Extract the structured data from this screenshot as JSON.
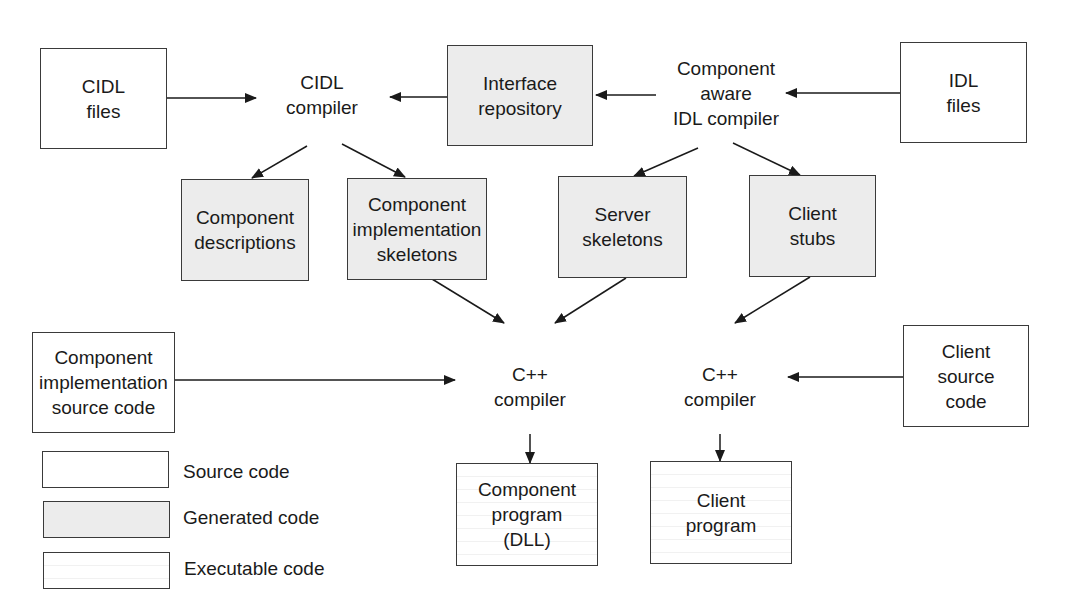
{
  "nodes": {
    "cidl_files": "CIDL\nfiles",
    "cidl_compiler": "CIDL\ncompiler",
    "interface_repository": "Interface\nrepository",
    "component_aware_idl_compiler": "Component\naware\nIDL compiler",
    "idl_files": "IDL\nfiles",
    "component_descriptions": "Component\ndescriptions",
    "component_implementation_skeletons": "Component\nimplementation\nskeletons",
    "server_skeletons": "Server\nskeletons",
    "client_stubs": "Client\nstubs",
    "component_implementation_source_code": "Component\nimplementation\nsource code",
    "cpp_compiler_component": "C++\ncompiler",
    "cpp_compiler_client": "C++\ncompiler",
    "client_source_code": "Client\nsource\ncode",
    "component_program": "Component\nprogram\n(DLL)",
    "client_program": "Client\nprogram"
  },
  "legend": {
    "source": "Source code",
    "generated": "Generated code",
    "executable": "Executable code"
  },
  "colors": {
    "line": "#1a1a1a",
    "generated_fill": "#ececec",
    "source_fill": "#ffffff"
  },
  "edges": [
    [
      "cidl_files",
      "cidl_compiler"
    ],
    [
      "interface_repository",
      "cidl_compiler"
    ],
    [
      "component_aware_idl_compiler",
      "interface_repository"
    ],
    [
      "idl_files",
      "component_aware_idl_compiler"
    ],
    [
      "cidl_compiler",
      "component_descriptions"
    ],
    [
      "cidl_compiler",
      "component_implementation_skeletons"
    ],
    [
      "component_aware_idl_compiler",
      "server_skeletons"
    ],
    [
      "component_aware_idl_compiler",
      "client_stubs"
    ],
    [
      "component_implementation_skeletons",
      "cpp_compiler_component"
    ],
    [
      "server_skeletons",
      "cpp_compiler_component"
    ],
    [
      "client_stubs",
      "cpp_compiler_client"
    ],
    [
      "component_implementation_source_code",
      "cpp_compiler_component"
    ],
    [
      "client_source_code",
      "cpp_compiler_client"
    ],
    [
      "cpp_compiler_component",
      "component_program"
    ],
    [
      "cpp_compiler_client",
      "client_program"
    ]
  ]
}
